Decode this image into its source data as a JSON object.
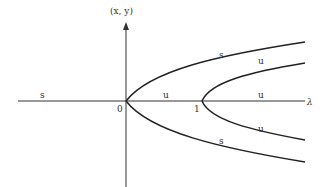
{
  "diagram": {
    "y_axis_label": "(x, y)",
    "x_axis_label": "λ",
    "origin_label": "0",
    "tick_one_label": "1",
    "branches": [
      {
        "id": "trivial-left",
        "stability": "s"
      },
      {
        "id": "trivial-middle",
        "stability": "u"
      },
      {
        "id": "trivial-right",
        "stability": "u"
      },
      {
        "id": "outer-upper",
        "stability": "s",
        "bifurcation_point": 0
      },
      {
        "id": "outer-lower",
        "stability": "s",
        "bifurcation_point": 0
      },
      {
        "id": "inner-upper",
        "stability": "u",
        "bifurcation_point": 1
      },
      {
        "id": "inner-lower",
        "stability": "u",
        "bifurcation_point": 1
      }
    ]
  }
}
